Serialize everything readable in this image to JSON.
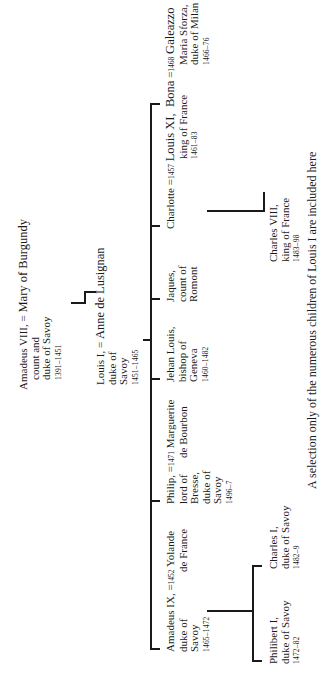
{
  "generation1": {
    "husband": {
      "name": "Amadeus VIII,",
      "lines": [
        "count and",
        "duke of Savoy"
      ],
      "years": "1391–1451"
    },
    "marriage_sign": "=",
    "wife": {
      "name": "Mary of Burgundy"
    }
  },
  "generation2": {
    "husband": {
      "name": "Louis I,",
      "lines": [
        "duke of",
        "Savoy"
      ],
      "years": "1451–1465"
    },
    "marriage_sign": "=",
    "wife": {
      "name": "Anne de Lusignan"
    }
  },
  "children": [
    {
      "name": "Amadeus IX,",
      "lines": [
        "duke of",
        "Savoy"
      ],
      "years": "1465–1472",
      "marriage_sign": "=",
      "marriage_year": "1452",
      "spouse": {
        "name": "Yolande",
        "lines": [
          "de France"
        ]
      }
    },
    {
      "name": "Philip,",
      "lines": [
        "lord of",
        "Bresse,",
        "duke of",
        "Savoy"
      ],
      "years": "1496–7",
      "marriage_sign": "=",
      "marriage_year": "1471",
      "spouse": {
        "name": "Marguerite",
        "lines": [
          "de Bourbon"
        ]
      }
    },
    {
      "name": "Jehan Louis,",
      "lines": [
        "bishop of",
        "Geneva"
      ],
      "years": "1460–1482"
    },
    {
      "name": "Jaques,",
      "lines": [
        "count of",
        "Romont"
      ]
    },
    {
      "name": "Charlotte",
      "marriage_sign": "=",
      "marriage_year": "1457",
      "spouse": {
        "name": "Louis XI,",
        "lines": [
          "king of France"
        ],
        "years": "1461–83"
      }
    },
    {
      "name": "Bona",
      "marriage_sign": "=",
      "marriage_year": "1468",
      "spouse": {
        "name": "Galeazzo",
        "lines": [
          "Maria Sforza,",
          "duke of Milan"
        ],
        "years": "1466–76"
      }
    }
  ],
  "grandchildren_amadeus_ix": [
    {
      "name": "Philibert I,",
      "lines": [
        "duke of Savoy"
      ],
      "years": "1472–82"
    },
    {
      "name": "Charles I,",
      "lines": [
        "duke of Savoy"
      ],
      "years": "1482–9"
    }
  ],
  "grandchildren_charlotte": [
    {
      "name": "Charles VIII,",
      "lines": [
        "king of France"
      ],
      "years": "1483–98"
    }
  ],
  "footnote": "A selection only of the numerous children of Louis I are included here"
}
